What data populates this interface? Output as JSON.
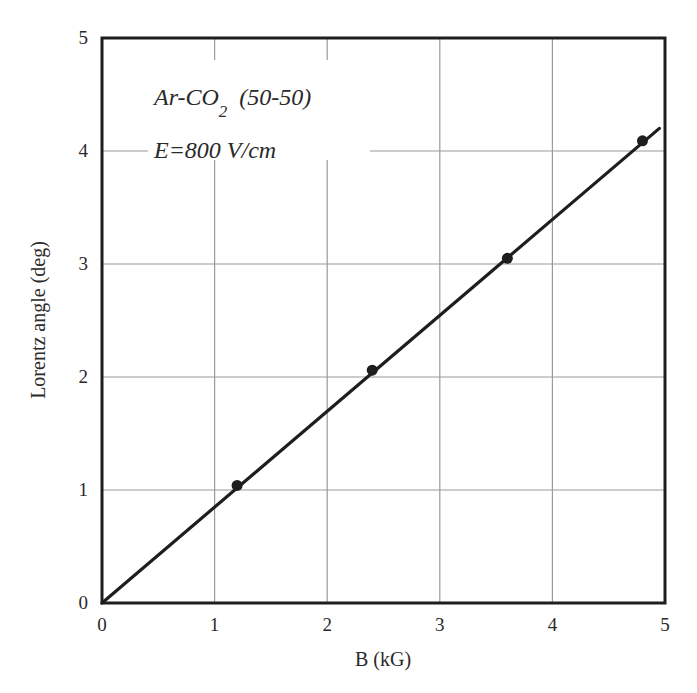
{
  "chart_data": {
    "type": "scatter",
    "title": "",
    "xlabel": "B (kG)",
    "ylabel": "Lorentz angle (deg)",
    "xlim": [
      0,
      5
    ],
    "ylim": [
      0,
      5
    ],
    "x_ticks": [
      "0",
      "1",
      "2",
      "3",
      "4",
      "5"
    ],
    "y_ticks": [
      "0",
      "1",
      "2",
      "3",
      "4",
      "5"
    ],
    "grid": true,
    "legend": null,
    "annotations": [
      "Ar-CO2 (50-50)",
      "E=800 V/cm"
    ],
    "series": [
      {
        "name": "measured",
        "type": "scatter",
        "x": [
          1.2,
          2.4,
          3.6,
          4.8
        ],
        "y": [
          1.04,
          2.06,
          3.05,
          4.09
        ]
      },
      {
        "name": "linear fit",
        "type": "line",
        "x": [
          0,
          4.95
        ],
        "y": [
          0,
          4.2
        ]
      }
    ]
  },
  "annotation": {
    "line1_main": "Ar-CO",
    "line1_sub": "2",
    "line1_tail": "(50-50)",
    "line2": "E=800 V/cm"
  },
  "colors": {
    "axes": "#1e1e1e",
    "grid": "#9a9a9a",
    "line": "#1e1e1e",
    "points": "#1e1e1e"
  }
}
